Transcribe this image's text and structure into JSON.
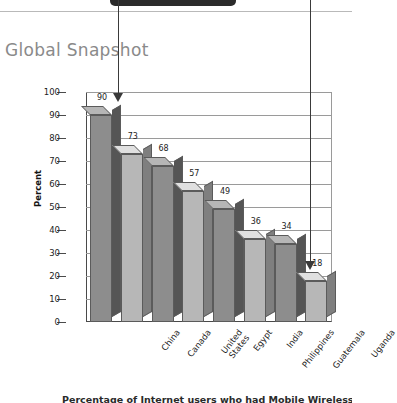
{
  "page": {
    "title": "Global Snapshot",
    "caption": "Percentage of Internet users who had Mobile Wireless subscriptions"
  },
  "annotations": [
    {
      "name": "arrow-to-first-bar",
      "points_to": "China"
    },
    {
      "name": "arrow-to-last-bar",
      "points_to": "Uganda"
    }
  ],
  "chart_data": {
    "type": "bar",
    "title": "Global Snapshot",
    "xlabel": "",
    "ylabel": "Percent",
    "ylim": [
      0,
      100
    ],
    "yticks": [
      0,
      10,
      20,
      30,
      40,
      50,
      60,
      70,
      80,
      90,
      100
    ],
    "grid": true,
    "legend": "none",
    "categories": [
      "China",
      "Canada",
      "United States",
      "Egypt",
      "India",
      "Philippines",
      "Guatemala",
      "Uganda"
    ],
    "values": [
      90,
      73,
      68,
      57,
      49,
      36,
      34,
      18
    ],
    "bar_colors": [
      "#8d8d8d",
      "#b7b7b7",
      "#8d8d8d",
      "#b7b7b7",
      "#8d8d8d",
      "#b7b7b7",
      "#8d8d8d",
      "#b7b7b7"
    ]
  },
  "colors": {
    "banner": "#2b2b2b",
    "title": "#8a8a8a",
    "axis": "#4a4a4a",
    "grid": "#9a9a9a",
    "arrow": "#3a3a3a"
  }
}
